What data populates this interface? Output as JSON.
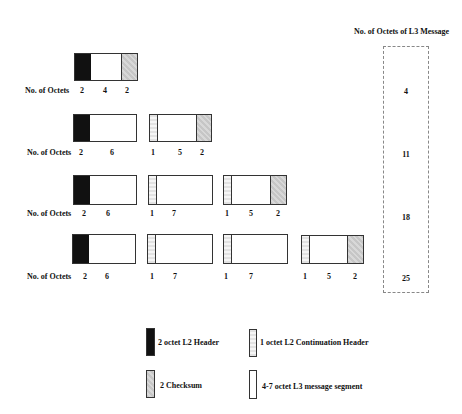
{
  "title": "No. of Octets of L3 Message",
  "row_label": "No. of Octets",
  "rows": [
    {
      "l3_total": "4",
      "frames": [
        {
          "labels": [
            "2",
            "4",
            "2"
          ]
        }
      ]
    },
    {
      "l3_total": "11",
      "frames": [
        {
          "labels": [
            "2",
            "6"
          ]
        },
        {
          "labels": [
            "1",
            "5",
            "2"
          ]
        }
      ]
    },
    {
      "l3_total": "18",
      "frames": [
        {
          "labels": [
            "2",
            "6"
          ]
        },
        {
          "labels": [
            "1",
            "7"
          ]
        },
        {
          "labels": [
            "1",
            "5",
            "2"
          ]
        }
      ]
    },
    {
      "l3_total": "25",
      "frames": [
        {
          "labels": [
            "2",
            "6"
          ]
        },
        {
          "labels": [
            "1",
            "7"
          ]
        },
        {
          "labels": [
            "1",
            "7"
          ]
        },
        {
          "labels": [
            "1",
            "5",
            "2"
          ]
        }
      ]
    }
  ],
  "legend": {
    "l2_header": "2 octet L2 Header",
    "continuation_header": "1 octet L2 Continuation Header",
    "checksum": "2 Checksum",
    "l3_segment": "4-7 octet L3 message segment"
  },
  "colors": {
    "l2_header": "#111111",
    "continuation_header": "#efefef",
    "checksum": "#cfcfcf",
    "l3_segment": "#ffffff",
    "dashed_border": "#888888"
  }
}
